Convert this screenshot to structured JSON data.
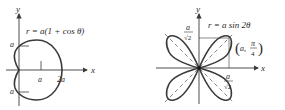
{
  "left_plot": {
    "equation": "r = a(1 + cos θ)",
    "axis_x_label": "x",
    "axis_y_label": "y",
    "tick_label_a": "a",
    "tick_label_2a": "2a",
    "y_label_top": "a",
    "y_label_bottom": "a",
    "curve": "cardioid"
  },
  "right_plot": {
    "equation": "r = a sin 2θ",
    "axis_x_label": "x",
    "axis_y_label": "y",
    "point_label_open": "(",
    "point_label_a": "a,",
    "point_label_pi": "π",
    "point_label_four": "4",
    "point_label_close": ")",
    "frac_top_num": "a",
    "frac_top_den": "√2",
    "frac_bottom_num": "a",
    "frac_bottom_den": "√2",
    "curve": "four-leaved rose"
  },
  "colors": {
    "curve": "#3a3a3a",
    "axis": "#3a3a3a",
    "text": "#2a2a2a"
  }
}
